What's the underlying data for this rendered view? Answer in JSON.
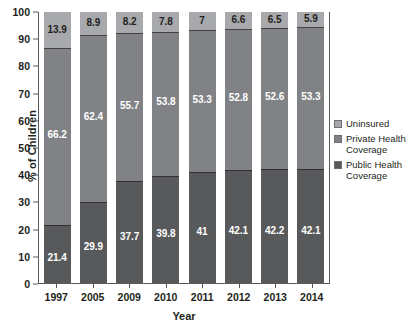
{
  "chart_data": {
    "type": "bar",
    "subtype": "stacked-bar-100",
    "title": "",
    "xlabel": "Year",
    "ylabel": "% of Children",
    "categories": [
      "1997",
      "2005",
      "2009",
      "2010",
      "2011",
      "2012",
      "2013",
      "2014"
    ],
    "ylim": [
      0,
      100
    ],
    "yticks": [
      0,
      10,
      20,
      30,
      40,
      50,
      60,
      70,
      80,
      90,
      100
    ],
    "grid": false,
    "legend_position": "right",
    "series": [
      {
        "name": "Public Health Coverage",
        "color": "#58595b",
        "values": [
          21.4,
          29.9,
          37.7,
          39.8,
          41,
          42.1,
          42.2,
          42.1
        ],
        "labels": [
          "21.4",
          "29.9",
          "37.7",
          "39.8",
          "41",
          "42.1",
          "42.2",
          "42.1"
        ]
      },
      {
        "name": "Private Health Coverage",
        "color": "#808285",
        "values": [
          66.2,
          62.4,
          55.7,
          53.8,
          53.3,
          52.8,
          52.6,
          53.3
        ],
        "labels": [
          "66.2",
          "62.4",
          "55.7",
          "53.8",
          "53.3",
          "52.8",
          "52.6",
          "53.3"
        ]
      },
      {
        "name": "Uninsured",
        "color": "#a7a9ac",
        "values": [
          13.9,
          8.9,
          8.2,
          7.8,
          7,
          6.6,
          6.5,
          5.9
        ],
        "labels": [
          "13.9",
          "8.9",
          "8.2",
          "7.8",
          "7",
          "6.6",
          "6.5",
          "5.9"
        ]
      }
    ]
  },
  "legend": {
    "items": [
      {
        "label": "Uninsured",
        "color": "#a7a9ac"
      },
      {
        "label": "Private Health Coverage",
        "color": "#808285"
      },
      {
        "label": "Public Health Coverage",
        "color": "#58595b"
      }
    ]
  }
}
